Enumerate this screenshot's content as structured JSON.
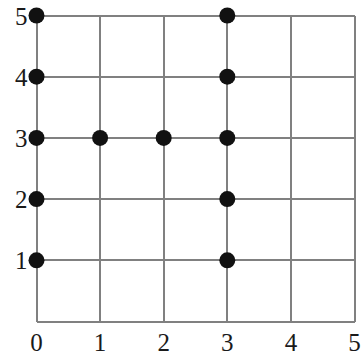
{
  "chart_data": {
    "type": "scatter",
    "title": "",
    "subtitle": "",
    "xlabel": "",
    "ylabel": "",
    "xlim": [
      0,
      5
    ],
    "ylim": [
      0,
      5
    ],
    "xticks": [
      0,
      1,
      2,
      3,
      4,
      5
    ],
    "yticks": [
      1,
      2,
      3,
      4,
      5
    ],
    "xtick_labels": [
      "0",
      "1",
      "2",
      "3",
      "4",
      "5"
    ],
    "ytick_labels": [
      "1",
      "2",
      "3",
      "4",
      "5"
    ],
    "grid": true,
    "grid_color": "#808080",
    "axis_color": "#808080",
    "legend": null,
    "legend_position": "none",
    "marker": {
      "shape": "circle",
      "color": "#111111",
      "radius_px": 8
    },
    "annotations": [],
    "series": [
      {
        "name": "points",
        "color": "#111111",
        "points": [
          {
            "x": 0,
            "y": 5
          },
          {
            "x": 3,
            "y": 5
          },
          {
            "x": 0,
            "y": 4
          },
          {
            "x": 3,
            "y": 4
          },
          {
            "x": 0,
            "y": 3
          },
          {
            "x": 1,
            "y": 3
          },
          {
            "x": 2,
            "y": 3
          },
          {
            "x": 3,
            "y": 3
          },
          {
            "x": 0,
            "y": 2
          },
          {
            "x": 3,
            "y": 2
          },
          {
            "x": 0,
            "y": 1
          },
          {
            "x": 3,
            "y": 1
          }
        ]
      }
    ]
  }
}
